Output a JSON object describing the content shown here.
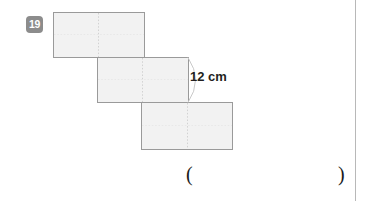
{
  "page": {
    "width": 369,
    "height": 201,
    "background": "#ffffff"
  },
  "question": {
    "number": "19",
    "badge_color": "#8c8c8c",
    "badge_text_color": "#ffffff"
  },
  "figure": {
    "name": "staircase-of-three-squares",
    "fill": "#f2f2f2",
    "stroke": "#9a9a9a",
    "dashed_stroke": "#cfcfcf",
    "squares": [
      {
        "name": "top-square",
        "x": 53,
        "y": 12,
        "width": 91,
        "height": 45,
        "divider_x": 98
      },
      {
        "name": "middle-square",
        "x": 97,
        "y": 57,
        "width": 91,
        "height": 45,
        "divider_x": 142
      },
      {
        "name": "bottom-square",
        "x": 141,
        "y": 102,
        "width": 91,
        "height": 48,
        "divider_x": 187
      }
    ],
    "arc": {
      "name": "dimension-arc",
      "start_x": 188,
      "start_y": 57,
      "end_x": 188,
      "end_y": 102,
      "bulge": 14
    }
  },
  "dimension": {
    "label": "12 cm",
    "value": 12,
    "unit": "cm",
    "color": "#231f20"
  },
  "answer": {
    "paren_open": "(",
    "paren_close": ")",
    "value": ""
  }
}
